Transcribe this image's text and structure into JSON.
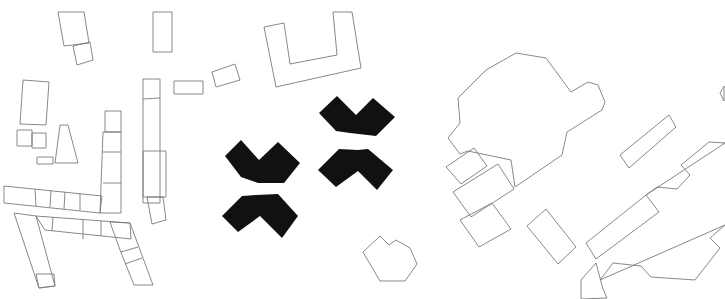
{
  "diagram": {
    "type": "figure-ground site plan",
    "background_color": "#ffffff",
    "existing_stroke_color": "#7a7a7a",
    "proposed_fill_color": "#111111",
    "existing_buildings": [
      {
        "id": "nw-tilted-block",
        "points": "58,12 84,12 89,43 64,46"
      },
      {
        "id": "nw-small-square",
        "points": "73,46 90,42 93,60 77,65"
      },
      {
        "id": "north-narrow-block",
        "points": "153,12 172,12 172,52 153,52"
      },
      {
        "id": "west-block",
        "points": "23,80 49,82 46,125 20,124"
      },
      {
        "id": "west-square-a",
        "points": "17,130 32,130 32,146 17,146"
      },
      {
        "id": "west-square-b",
        "points": "32,133 46,133 46,148 32,148"
      },
      {
        "id": "west-small-bar",
        "points": "37,157 53,157 53,164 37,164"
      },
      {
        "id": "west-trapezoid",
        "points": "60,125 68,125 78,163 55,163"
      },
      {
        "id": "central-column-top",
        "points": "105,111 121,111 121,132 105,132"
      },
      {
        "id": "central-column",
        "points": "103,132 121,132 121,213 100,213 103,132"
      },
      {
        "id": "central-column-div-1",
        "points": "103,152 121,152",
        "line": true
      },
      {
        "id": "central-column-div-2",
        "points": "103,183 121,183",
        "line": true
      },
      {
        "id": "west-row",
        "points": "4,186 102,196 100,213 4,203"
      },
      {
        "id": "west-row-div-1",
        "points": "35,189 36,206",
        "line": true
      },
      {
        "id": "west-row-div-2",
        "points": "51,190 50,207",
        "line": true
      },
      {
        "id": "west-row-div-3",
        "points": "65,192 64,209",
        "line": true
      },
      {
        "id": "west-row-div-4",
        "points": "80,193 80,210",
        "line": true
      },
      {
        "id": "tall-column",
        "points": "143,79 160,79 160,203 143,203"
      },
      {
        "id": "tall-column-div",
        "points": "143,99 160,98",
        "line": true
      },
      {
        "id": "tall-column-wide",
        "points": "143,151 166,151 166,197 143,197"
      },
      {
        "id": "tall-column-foot",
        "points": "147,197 163,197 166,220 152,224"
      },
      {
        "id": "small-bar-east",
        "points": "174,81 203,81 203,94 174,94"
      },
      {
        "id": "small-tilted-bar",
        "points": "212,72 235,64 240,80 216,87"
      },
      {
        "id": "u-shaped-building",
        "points": "264,27 284,23 290,64 337,55 333,12 352,12 361,68 276,87"
      },
      {
        "id": "south-u-left-arm",
        "points": "14,213 36,216 55,286 39,288"
      },
      {
        "id": "south-u-left-foot",
        "points": "36,274 54,274 55,286 39,288"
      },
      {
        "id": "south-u-bridge",
        "points": "36,216 130,223 131,239 45,230"
      },
      {
        "id": "south-u-bridge-div-1",
        "points": "53,217 52,231",
        "line": true
      },
      {
        "id": "south-u-bridge-div-2",
        "points": "83,219 83,239",
        "line": true
      },
      {
        "id": "south-u-bridge-div-3",
        "points": "101,221 101,236",
        "line": true
      },
      {
        "id": "south-u-right-arm",
        "points": "110,222 130,223 153,285 134,285 120,250"
      },
      {
        "id": "south-u-right-div-1",
        "points": "121,252 138,247",
        "line": true
      },
      {
        "id": "south-u-right-div-2",
        "points": "125,264 142,258",
        "line": true
      },
      {
        "id": "large-east-complex",
        "points": "458,98 486,70 516,53 546,58 571,92 588,82 598,85 605,102 602,110 567,132 562,155 515,187 511,160 468,151 460,154 448,138 460,123 458,98"
      },
      {
        "id": "east-annex-a",
        "points": "446,167 474,148 487,166 461,184"
      },
      {
        "id": "east-annex-b",
        "points": "453,192 498,164 514,189 471,217"
      },
      {
        "id": "east-annex-c",
        "points": "460,220 492,203 511,229 479,247"
      },
      {
        "id": "east-free-block",
        "points": "527,226 546,209 576,247 558,264"
      },
      {
        "id": "east-diagonal-bar",
        "points": "620,155 669,115 676,127 629,168"
      },
      {
        "id": "hexagonal-pavilion",
        "points": "363,252 380,236 389,245 396,240 410,248 417,264 405,281 380,281"
      },
      {
        "id": "east-row-building",
        "points": "586,243 646,195 659,212 596,259"
      },
      {
        "id": "east-row-wall",
        "points": "646,195 657,187 677,189 690,175 681,165 709,142 725,143"
      },
      {
        "id": "southeast-courtyard",
        "points": "581,299 581,280 596,263 603,289 607,298"
      },
      {
        "id": "southeast-wall",
        "points": "600,280 613,263 641,266 651,277 695,280 720,248 710,238 725,225"
      },
      {
        "id": "far-east-arc",
        "points": "724,86 720,93 724,101"
      }
    ],
    "proposed_buildings": [
      {
        "id": "chevron-west-upper",
        "shape": "v",
        "points": "225,156 241,140 259,160 278,142 300,163 284,183 258,183 241,177"
      },
      {
        "id": "chevron-west-lower",
        "shape": "caret",
        "points": "222,216 242,196 256,195 278,194 298,216 282,238 260,216 238,232"
      },
      {
        "id": "chevron-east-upper",
        "shape": "v",
        "points": "319,113 337,96 356,115 373,98 395,117 376,136 350,133 336,131"
      },
      {
        "id": "chevron-east-lower",
        "shape": "caret",
        "points": "318,170 339,149 358,150 368,149 393,170 377,190 358,171 336,187"
      }
    ]
  }
}
